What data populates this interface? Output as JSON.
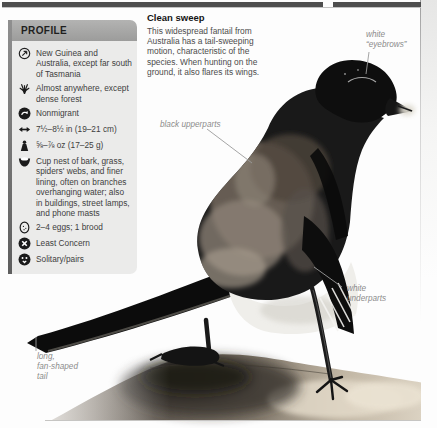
{
  "page": {
    "kind": "bird field-guide page"
  },
  "colors": {
    "page_bg": "#fdfdfd",
    "top_bar": "#4e4e4e",
    "profile_header_bg": "#a8a8a7",
    "profile_body_bg": "#ebebea",
    "profile_strip": "#6e6e6e",
    "body_text": "#4c4c4c",
    "annotation_text": "#8c8c8c",
    "bird_black": "#111111",
    "log_brown": "#6b6459"
  },
  "profile": {
    "title": "PROFILE",
    "items": [
      {
        "icon": "distribution-icon",
        "text": "New Guinea and Australia, except far south of Tasmania"
      },
      {
        "icon": "habitat-icon",
        "text": "Almost anywhere, except dense forest"
      },
      {
        "icon": "migration-icon",
        "text": "Nonmigrant"
      },
      {
        "icon": "length-icon",
        "text": "7½–8½ in (19–21 cm)"
      },
      {
        "icon": "weight-icon",
        "text": "⅝–⅞ oz (17–25 g)"
      },
      {
        "icon": "nest-icon",
        "text": "Cup nest of bark, grass, spiders' webs, and finer lining, often on branches overhanging water; also in buildings, street lamps, and phone masts"
      },
      {
        "icon": "eggs-icon",
        "text": "2–4 eggs; 1 brood"
      },
      {
        "icon": "status-icon",
        "text": "Least Concern"
      },
      {
        "icon": "social-icon",
        "text": "Solitary/pairs"
      }
    ]
  },
  "feature": {
    "heading": "Clean sweep",
    "body": "This widespread fantail from Australia has a tail-sweeping motion, characteristic of the species. When hunting on the ground, it also flares its wings."
  },
  "annotations": {
    "eyebrows": {
      "lines": [
        "white",
        "“eyebrows”"
      ]
    },
    "upperparts": {
      "lines": [
        "black upperparts"
      ]
    },
    "underparts": {
      "lines": [
        "white",
        "underparts"
      ]
    },
    "tail": {
      "lines": [
        "long,",
        "fan-shaped",
        "tail"
      ]
    }
  }
}
